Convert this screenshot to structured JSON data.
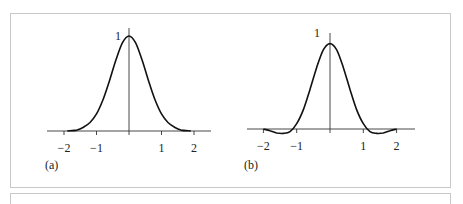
{
  "chart_data": [
    {
      "type": "line",
      "panel_label": "(a)",
      "title": "",
      "xlabel": "",
      "ylabel": "",
      "x_ticks": [
        -2,
        -1,
        1,
        2
      ],
      "x_tick_labels": [
        "−2",
        "−1",
        "1",
        "2"
      ],
      "y_tick_labels": [
        "1"
      ],
      "xlim": [
        -2.5,
        2.5
      ],
      "ylim": [
        0,
        1
      ],
      "grid": false,
      "series": [
        {
          "name": "gaussian",
          "x": [
            -1.9,
            -1.6,
            -1.4,
            -1.2,
            -1.0,
            -0.8,
            -0.6,
            -0.4,
            -0.2,
            0,
            0.2,
            0.4,
            0.6,
            0.8,
            1.0,
            1.2,
            1.4,
            1.6,
            1.9
          ],
          "y": [
            0.0,
            0.01,
            0.04,
            0.09,
            0.18,
            0.33,
            0.53,
            0.75,
            0.93,
            1.0,
            0.93,
            0.75,
            0.53,
            0.33,
            0.18,
            0.09,
            0.04,
            0.01,
            0.0
          ]
        }
      ]
    },
    {
      "type": "line",
      "panel_label": "(b)",
      "title": "",
      "xlabel": "",
      "ylabel": "",
      "x_ticks": [
        -2,
        -1,
        1,
        2
      ],
      "x_tick_labels": [
        "−2",
        "−1",
        "1",
        "2"
      ],
      "y_tick_labels": [
        "1"
      ],
      "xlim": [
        -2.5,
        2.5
      ],
      "ylim": [
        -0.05,
        1.1
      ],
      "grid": false,
      "series": [
        {
          "name": "windowed-sinc",
          "x": [
            -2.0,
            -1.8,
            -1.6,
            -1.4,
            -1.2,
            -1.0,
            -0.8,
            -0.6,
            -0.4,
            -0.2,
            0,
            0.2,
            0.4,
            0.6,
            0.8,
            1.0,
            1.2,
            1.4,
            1.6,
            1.8,
            2.0
          ],
          "y": [
            0.0,
            -0.02,
            -0.045,
            -0.05,
            -0.03,
            0.06,
            0.22,
            0.45,
            0.7,
            0.9,
            0.97,
            0.9,
            0.7,
            0.45,
            0.22,
            0.06,
            -0.03,
            -0.05,
            -0.045,
            -0.02,
            0.0
          ]
        }
      ]
    }
  ],
  "panels": [
    {
      "label": "(a)",
      "peak_label": "1"
    },
    {
      "label": "(b)",
      "peak_label": "1"
    }
  ]
}
